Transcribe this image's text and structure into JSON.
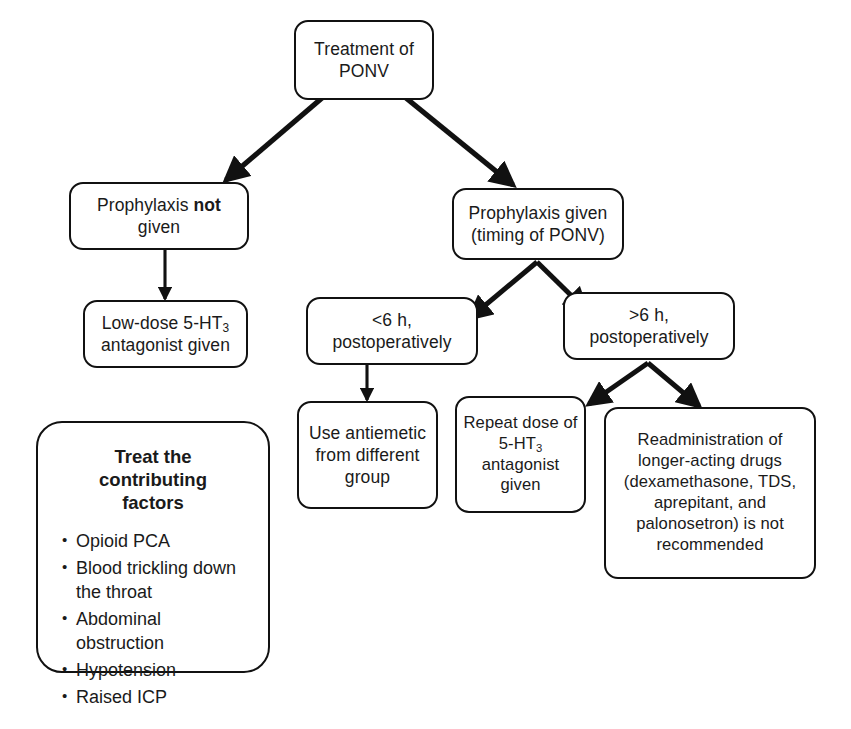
{
  "diagram": {
    "colors": {
      "stroke": "#111111",
      "background": "#ffffff",
      "text": "#1a1a1a"
    },
    "nodes": {
      "root": {
        "line1": "Treatment of",
        "line2": "PONV"
      },
      "no_prophylaxis": {
        "line1_pre": "Prophylaxis ",
        "line1_bold": "not",
        "line2": "given"
      },
      "low_dose": {
        "line1_pre": "Low-dose 5-HT",
        "line1_sub": "3",
        "line2": "antagonist given"
      },
      "prophylaxis_given": {
        "line1": "Prophylaxis given",
        "line2": "(timing of PONV)"
      },
      "under_6h": {
        "line1": "<6 h,",
        "line2": "postoperatively"
      },
      "over_6h": {
        "line1": ">6 h,",
        "line2": "postoperatively"
      },
      "use_antiemetic": {
        "text": "Use antiemetic\nfrom different\ngroup"
      },
      "repeat_dose": {
        "line1": "Repeat dose of",
        "line2_pre": "5-HT",
        "line2_sub": "3",
        "line3": "antagonist",
        "line4": "given"
      },
      "readministration": {
        "text": "Readministration of\nlonger-acting drugs\n(dexamethasone, TDS,\naprepitant, and\npalonosetron) is not\nrecommended"
      }
    },
    "panel": {
      "title": "Treat the contributing\nfactors",
      "items": [
        "Opioid PCA",
        "Blood trickling down\nthe throat",
        "Abdominal obstruction",
        "Hypotension",
        "Raised ICP"
      ]
    },
    "edges": [
      {
        "name": "root-to-no-prophylaxis",
        "from": "root",
        "to": "no_prophylaxis",
        "style": "diagonal-arrow"
      },
      {
        "name": "root-to-prophylaxis-given",
        "from": "root",
        "to": "prophylaxis_given",
        "style": "diagonal-arrow"
      },
      {
        "name": "no-prophylaxis-to-low-dose",
        "from": "no_prophylaxis",
        "to": "low_dose",
        "style": "vertical-arrow"
      },
      {
        "name": "prophylaxis-given-to-under-6h",
        "from": "prophylaxis_given",
        "to": "under_6h",
        "style": "diagonal-arrow"
      },
      {
        "name": "prophylaxis-given-to-over-6h",
        "from": "prophylaxis_given",
        "to": "over_6h",
        "style": "diagonal-arrow"
      },
      {
        "name": "under-6h-to-use-antiemetic",
        "from": "under_6h",
        "to": "use_antiemetic",
        "style": "vertical-arrow"
      },
      {
        "name": "over-6h-to-repeat-dose",
        "from": "over_6h",
        "to": "repeat_dose",
        "style": "diagonal-arrow"
      },
      {
        "name": "over-6h-to-readministration",
        "from": "over_6h",
        "to": "readministration",
        "style": "diagonal-arrow"
      }
    ]
  }
}
